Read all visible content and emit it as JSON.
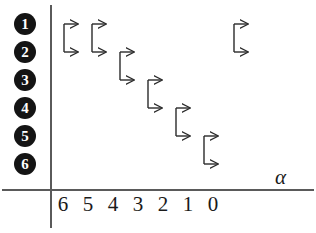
{
  "figure": {
    "type": "state-transition-diagram",
    "background_color": "#ffffff",
    "ink_color": "#1a1a1a",
    "axis_color": "#5a5a5a"
  },
  "row_labels": [
    {
      "id": "row-1",
      "text": "1",
      "y": 24
    },
    {
      "id": "row-2",
      "text": "2",
      "y": 52
    },
    {
      "id": "row-3",
      "text": "3",
      "y": 80
    },
    {
      "id": "row-4",
      "text": "4",
      "y": 108
    },
    {
      "id": "row-5",
      "text": "5",
      "y": 136
    },
    {
      "id": "row-6",
      "text": "6",
      "y": 164
    }
  ],
  "x_axis": {
    "label": "α",
    "label_x": 275,
    "label_y": 166,
    "ticks": [
      {
        "text": "6",
        "x": 63
      },
      {
        "text": "5",
        "x": 88
      },
      {
        "text": "4",
        "x": 113
      },
      {
        "text": "3",
        "x": 138
      },
      {
        "text": "2",
        "x": 163
      },
      {
        "text": "1",
        "x": 188
      },
      {
        "text": "0",
        "x": 213
      }
    ]
  },
  "axes_geometry": {
    "vertical_line": {
      "x": 51,
      "y_top": 5,
      "y_bottom": 228
    },
    "horizontal_line": {
      "y": 190,
      "x_left": 2,
      "x_right": 314
    }
  },
  "arrows": [
    {
      "id": "arrow-alpha-6",
      "alpha": "6",
      "from_row": "1",
      "to_row": "2",
      "x": 64,
      "y_top": 24,
      "y_bottom": 52,
      "width": 14
    },
    {
      "id": "arrow-alpha-5",
      "alpha": "5",
      "from_row": "1",
      "to_row": "2",
      "x": 92,
      "y_top": 24,
      "y_bottom": 52,
      "width": 14
    },
    {
      "id": "arrow-alpha-4",
      "alpha": "4",
      "from_row": "2",
      "to_row": "3",
      "x": 120,
      "y_top": 52,
      "y_bottom": 80,
      "width": 14
    },
    {
      "id": "arrow-alpha-3",
      "alpha": "3",
      "from_row": "3",
      "to_row": "4",
      "x": 148,
      "y_top": 80,
      "y_bottom": 108,
      "width": 14
    },
    {
      "id": "arrow-alpha-2",
      "alpha": "2",
      "from_row": "4",
      "to_row": "5",
      "x": 176,
      "y_top": 108,
      "y_bottom": 136,
      "width": 14
    },
    {
      "id": "arrow-alpha-1",
      "alpha": "1",
      "from_row": "5",
      "to_row": "6",
      "x": 204,
      "y_top": 136,
      "y_bottom": 164,
      "width": 14
    },
    {
      "id": "arrow-alpha-0",
      "alpha": "0",
      "from_row": "1",
      "to_row": "2",
      "x": 234,
      "y_top": 24,
      "y_bottom": 52,
      "width": 14
    }
  ],
  "chart_data": {
    "type": "scatter",
    "title": "",
    "xlabel": "α",
    "ylabel": "",
    "x": [
      "6",
      "5",
      "4",
      "3",
      "2",
      "1",
      "0"
    ],
    "series": [
      {
        "name": "transition-start-row",
        "values": [
          1,
          1,
          2,
          3,
          4,
          5,
          1
        ]
      },
      {
        "name": "transition-end-row",
        "values": [
          2,
          2,
          3,
          4,
          5,
          6,
          2
        ]
      }
    ],
    "ytick_labels": [
      "1",
      "2",
      "3",
      "4",
      "5",
      "6"
    ],
    "xtick_labels": [
      "6",
      "5",
      "4",
      "3",
      "2",
      "1",
      "0"
    ],
    "grid": false,
    "legend": "none"
  }
}
